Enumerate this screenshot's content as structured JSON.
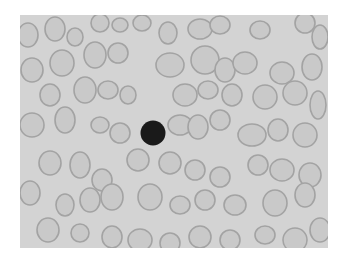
{
  "image": {
    "description": "Grayscale blood smear micrograph with one dark nucleated cell among red blood cells",
    "frame": {
      "x": 20,
      "y": 15,
      "width": 308,
      "height": 233
    },
    "colors": {
      "page": "#ffffff",
      "background": "#d3d3d3",
      "cell_fill": "#c9c9c9",
      "cell_rim": "#a3a3a3",
      "nucleus": "#1a1a1a"
    },
    "nucleated_cell": {
      "cx": 133,
      "cy": 118,
      "r": 12.5
    },
    "cells": [
      [
        8,
        20,
        10,
        12
      ],
      [
        35,
        14,
        10,
        12
      ],
      [
        55,
        22,
        8,
        9
      ],
      [
        80,
        8,
        9,
        9
      ],
      [
        100,
        10,
        8,
        7
      ],
      [
        122,
        8,
        9,
        8
      ],
      [
        148,
        18,
        9,
        11
      ],
      [
        180,
        14,
        12,
        10
      ],
      [
        200,
        10,
        10,
        9
      ],
      [
        240,
        15,
        10,
        9
      ],
      [
        285,
        8,
        10,
        10
      ],
      [
        300,
        22,
        8,
        12
      ],
      [
        12,
        55,
        11,
        12
      ],
      [
        42,
        48,
        12,
        13
      ],
      [
        75,
        40,
        11,
        13
      ],
      [
        98,
        38,
        10,
        10
      ],
      [
        150,
        50,
        14,
        12
      ],
      [
        185,
        45,
        14,
        14
      ],
      [
        205,
        55,
        10,
        12
      ],
      [
        225,
        48,
        12,
        11
      ],
      [
        262,
        58,
        12,
        11
      ],
      [
        292,
        52,
        10,
        13
      ],
      [
        30,
        80,
        10,
        11
      ],
      [
        65,
        75,
        11,
        13
      ],
      [
        88,
        75,
        10,
        9
      ],
      [
        108,
        80,
        8,
        9
      ],
      [
        165,
        80,
        12,
        11
      ],
      [
        188,
        75,
        10,
        9
      ],
      [
        212,
        80,
        10,
        11
      ],
      [
        245,
        82,
        12,
        12
      ],
      [
        275,
        78,
        12,
        12
      ],
      [
        298,
        90,
        8,
        14
      ],
      [
        12,
        110,
        12,
        12
      ],
      [
        45,
        105,
        10,
        13
      ],
      [
        80,
        110,
        9,
        8
      ],
      [
        100,
        118,
        10,
        10
      ],
      [
        160,
        110,
        12,
        10
      ],
      [
        178,
        112,
        10,
        12
      ],
      [
        200,
        105,
        10,
        10
      ],
      [
        232,
        120,
        14,
        11
      ],
      [
        258,
        115,
        10,
        11
      ],
      [
        285,
        120,
        12,
        12
      ],
      [
        30,
        148,
        11,
        12
      ],
      [
        60,
        150,
        10,
        13
      ],
      [
        82,
        165,
        10,
        11
      ],
      [
        118,
        145,
        11,
        11
      ],
      [
        150,
        148,
        11,
        11
      ],
      [
        175,
        155,
        10,
        10
      ],
      [
        200,
        162,
        10,
        10
      ],
      [
        238,
        150,
        10,
        10
      ],
      [
        262,
        155,
        12,
        11
      ],
      [
        290,
        160,
        11,
        12
      ],
      [
        10,
        178,
        10,
        12
      ],
      [
        45,
        190,
        9,
        11
      ],
      [
        70,
        185,
        10,
        12
      ],
      [
        92,
        182,
        11,
        13
      ],
      [
        130,
        182,
        12,
        13
      ],
      [
        160,
        190,
        10,
        9
      ],
      [
        185,
        185,
        10,
        10
      ],
      [
        215,
        190,
        11,
        10
      ],
      [
        255,
        188,
        12,
        13
      ],
      [
        285,
        180,
        10,
        12
      ],
      [
        28,
        215,
        11,
        12
      ],
      [
        60,
        218,
        9,
        9
      ],
      [
        92,
        222,
        10,
        11
      ],
      [
        120,
        225,
        12,
        11
      ],
      [
        150,
        228,
        10,
        10
      ],
      [
        180,
        222,
        11,
        11
      ],
      [
        210,
        225,
        10,
        10
      ],
      [
        245,
        220,
        10,
        9
      ],
      [
        275,
        225,
        12,
        12
      ],
      [
        300,
        215,
        10,
        12
      ]
    ]
  }
}
